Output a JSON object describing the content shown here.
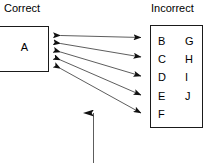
{
  "diagram": {
    "type": "mapping-diagram",
    "background_color": "#ffffff",
    "stroke_color": "#1a1a1a",
    "headings": {
      "left": "Correct",
      "right": "Incorrect"
    },
    "correct_group": {
      "items": [
        "A"
      ]
    },
    "incorrect_group": {
      "column_left": [
        "B",
        "C",
        "D",
        "E",
        "F"
      ],
      "column_right": [
        "G",
        "H",
        "I",
        "J"
      ]
    },
    "connections": {
      "count": 5,
      "style": "double-headed-arrow",
      "from": "A",
      "to": [
        "B",
        "C",
        "D",
        "E",
        "F"
      ]
    },
    "callout_arrow": {
      "direction": "up",
      "name": "pointer-arrow"
    }
  }
}
